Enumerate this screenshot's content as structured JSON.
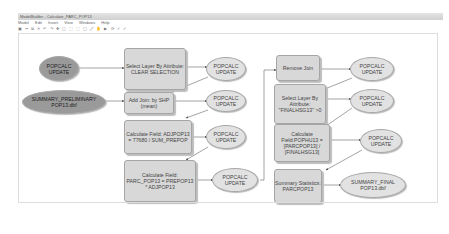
{
  "window": {
    "title": "ModelBuilder - Calculate_PARC_POP13"
  },
  "menu": [
    "Model",
    "Edit",
    "Insert",
    "View",
    "Windows",
    "Help"
  ],
  "toolbar": {
    "icons": "▣ ✂ ⧉ ✕ ↶ ↷ ✥ ▢ ⬚ ⬚ ▢ ⤢ ✋ ▶ ⟳ ✓ ✓"
  },
  "nodes": {
    "popcalc_update_input": "POPCALC UPDATE",
    "summary_preliminary": "SUMMARY_PRELIMINARY POP13.dbf",
    "select_clear": "Select Layer By Attribute: CLEAR SELECTION",
    "add_join": "Add Join: by SHP (mean)",
    "calc_adjpop": "Calculate Field: ADJPOP13 = 77680 / SUM_PREPOP",
    "calc_parc": "Calculate Field: PARC_POP13 = PREPOP13 * ADJPOP13",
    "out1": "POPCALC UPDATE",
    "out2": "POPCALC UPDATE",
    "out3": "POPCALC UPDATE",
    "out4": "POPCALC UPDATE",
    "remove_join": "Remove Join",
    "select_finalhsg": "Select Layer By Attribute: \"FINALHSG13\" >0",
    "calc_pophu": "Calculate Field:POPHU13 = [PARCPOP13] / [FINALHSG13]",
    "summary_stats": "Summary Statistics: PARCPOP13",
    "out5": "POPCALC UPDATE",
    "out6": "POPCALC UPDATE",
    "out7": "POPCALC UPDATE",
    "summary_final": "SUMMARY_FINAL POP13.dbf"
  }
}
